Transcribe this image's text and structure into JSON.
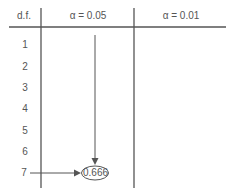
{
  "table": {
    "headers": [
      "d.f.",
      "α = 0.05",
      "α = 0.01"
    ],
    "rows": [
      "1",
      "2",
      "3",
      "4",
      "5",
      "6",
      "7"
    ],
    "highlighted_value": "0.666",
    "highlighted_row": "7",
    "highlighted_column": "α = 0.05"
  },
  "colors": {
    "line": "#555555",
    "text": "#555555"
  }
}
